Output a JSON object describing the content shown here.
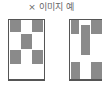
{
  "title": "× 이미지 예",
  "colors": {
    "fill": "#8a8a8a",
    "border": "#555555",
    "background": "#ffffff"
  },
  "figures": [
    {
      "name": "left-pattern",
      "cells": [
        "top-left",
        "top-right",
        "middle-center",
        "lower-left",
        "lower-right"
      ]
    },
    {
      "name": "right-pattern",
      "cells": [
        "top-left",
        "top-right",
        "center-tall",
        "bottom-left",
        "bottom-right"
      ]
    }
  ]
}
